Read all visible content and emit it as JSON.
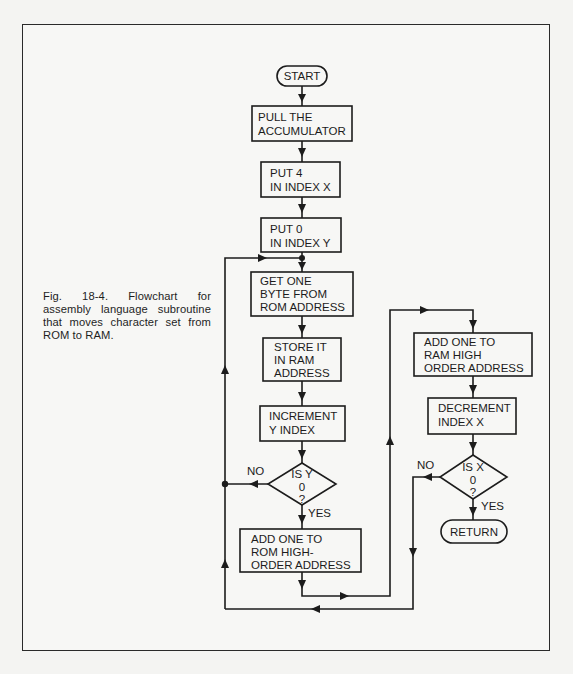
{
  "figure": {
    "caption": "Fig. 18-4. Flowchart for assembly language subroutine that moves character set from ROM to RAM."
  },
  "colors": {
    "ink": "#1c1c1c",
    "paper": "#f7f7f5",
    "background": "#f4f4f2"
  },
  "flowchart": {
    "nodes": [
      {
        "id": "start",
        "type": "terminal",
        "lines": [
          "START"
        ]
      },
      {
        "id": "pull",
        "type": "process",
        "lines": [
          "PULL THE",
          "ACCUMULATOR"
        ]
      },
      {
        "id": "put4",
        "type": "process",
        "lines": [
          "PUT 4",
          "IN INDEX X"
        ]
      },
      {
        "id": "put0",
        "type": "process",
        "lines": [
          "PUT 0",
          "IN INDEX Y"
        ]
      },
      {
        "id": "getbyte",
        "type": "process",
        "lines": [
          "GET ONE",
          "BYTE FROM",
          "ROM ADDRESS"
        ]
      },
      {
        "id": "store",
        "type": "process",
        "lines": [
          "STORE IT",
          "IN RAM",
          "ADDRESS"
        ]
      },
      {
        "id": "incy",
        "type": "process",
        "lines": [
          "INCREMENT",
          "Y INDEX"
        ]
      },
      {
        "id": "isy0",
        "type": "decision",
        "lines": [
          "IS Y",
          "0",
          "?"
        ]
      },
      {
        "id": "addrom",
        "type": "process",
        "lines": [
          "ADD ONE TO",
          "ROM HIGH-",
          "ORDER ADDRESS"
        ]
      },
      {
        "id": "addram",
        "type": "process",
        "lines": [
          "ADD ONE TO",
          "RAM HIGH",
          "ORDER ADDRESS"
        ]
      },
      {
        "id": "decx",
        "type": "process",
        "lines": [
          "DECREMENT",
          "INDEX X"
        ]
      },
      {
        "id": "isx0",
        "type": "decision",
        "lines": [
          "IS X",
          "0",
          "?"
        ]
      },
      {
        "id": "return",
        "type": "terminal",
        "lines": [
          "RETURN"
        ]
      }
    ],
    "labels": {
      "y_no": "NO",
      "y_yes": "YES",
      "x_no": "NO",
      "x_yes": "YES"
    }
  }
}
